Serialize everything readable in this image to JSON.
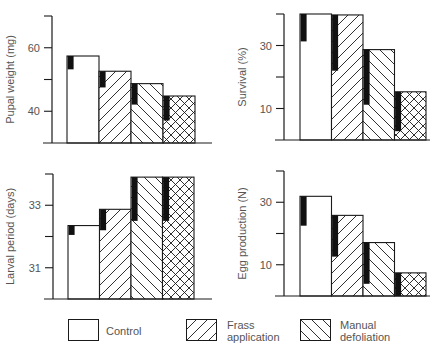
{
  "figure": {
    "colors": {
      "line": "#1a1a1a",
      "bar_fill": "#ffffff",
      "error_bar": "#111111",
      "text": "#555555"
    }
  },
  "legend": {
    "items": [
      {
        "label": "Control",
        "pattern": "none"
      },
      {
        "label": "Frass\napplication",
        "pattern": "forward-diagonal"
      },
      {
        "label": "Manual\ndefoliation",
        "pattern": "back-diagonal"
      }
    ]
  },
  "chart_data": [
    {
      "type": "bar",
      "title": "",
      "ylabel": "Pupal weight (mg)",
      "categories": [
        "Control",
        "Frass application",
        "Manual defoliation",
        "Frass + Manual defoliation"
      ],
      "patterns": [
        "none",
        "forward-diagonal",
        "back-diagonal",
        "crosshatch"
      ],
      "values": [
        57.4,
        52.6,
        48.7,
        44.8
      ],
      "error_lower": [
        53.2,
        47.5,
        42.1,
        37.1
      ],
      "ylim": [
        30,
        70
      ],
      "yticks": [
        30,
        40,
        50,
        60,
        70
      ],
      "ytick_labels": [
        "",
        "40",
        "",
        "60",
        ""
      ]
    },
    {
      "type": "bar",
      "title": "",
      "ylabel": "Survival (%)",
      "categories": [
        "Control",
        "Frass application",
        "Manual defoliation",
        "Frass + Manual defoliation"
      ],
      "patterns": [
        "none",
        "forward-diagonal",
        "back-diagonal",
        "crosshatch"
      ],
      "values": [
        40.0,
        39.7,
        28.7,
        15.3
      ],
      "error_lower": [
        31.3,
        22.0,
        11.2,
        2.8
      ],
      "ylim": [
        0,
        40
      ],
      "yticks": [
        0,
        10,
        20,
        30,
        40
      ],
      "ytick_labels": [
        "",
        "10",
        "",
        "30",
        ""
      ]
    },
    {
      "type": "bar",
      "title": "",
      "ylabel": "Larval period (days)",
      "categories": [
        "Control",
        "Frass application",
        "Manual defoliation",
        "Frass + Manual defoliation"
      ],
      "patterns": [
        "none",
        "forward-diagonal",
        "back-diagonal",
        "crosshatch"
      ],
      "values": [
        32.35,
        32.87,
        33.9,
        33.9
      ],
      "error_lower": [
        32.05,
        32.2,
        32.5,
        32.5
      ],
      "ylim": [
        30,
        34
      ],
      "yticks": [
        30,
        31,
        32,
        33,
        34
      ],
      "ytick_labels": [
        "",
        "31",
        "",
        "33",
        ""
      ]
    },
    {
      "type": "bar",
      "title": "",
      "ylabel": "Egg production (N)",
      "categories": [
        "Control",
        "Frass application",
        "Manual defoliation",
        "Frass + Manual defoliation"
      ],
      "patterns": [
        "none",
        "forward-diagonal",
        "back-diagonal",
        "crosshatch"
      ],
      "values": [
        31.9,
        25.8,
        17.1,
        7.4
      ],
      "error_lower": [
        22.5,
        12.6,
        3.9,
        0.0
      ],
      "ylim": [
        0,
        40
      ],
      "yticks": [
        0,
        10,
        20,
        30,
        40
      ],
      "ytick_labels": [
        "",
        "10",
        "",
        "30",
        ""
      ]
    }
  ]
}
